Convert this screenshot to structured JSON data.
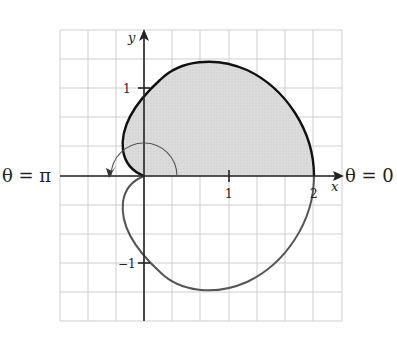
{
  "diagram": {
    "type": "polar-cardioid",
    "equation_implied": "r = 1 + cos(theta)",
    "shaded_region": "upper half (0 ≤ θ ≤ π)",
    "axes": {
      "x_label": "x",
      "y_label": "y",
      "x_ticks": [
        "1",
        "2"
      ],
      "y_ticks": [
        "1",
        "−1"
      ]
    },
    "angle_labels": {
      "zero": "θ = 0",
      "pi": "θ = π"
    },
    "grid": {
      "cols": 10,
      "rows": 10,
      "unit_cells": 2
    },
    "colors": {
      "grid": "#cfcfcf",
      "shade": "#d9d9d9",
      "upper_curve": "#111111",
      "lower_curve": "#555555",
      "axes": "#222222"
    }
  }
}
